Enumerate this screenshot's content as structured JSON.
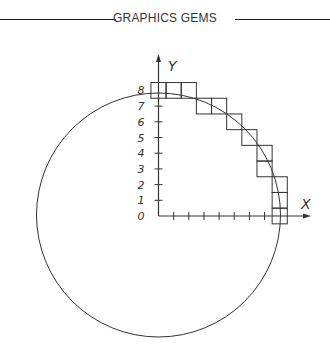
{
  "header": {
    "title": "GRAPHICS GEMS"
  },
  "diagram": {
    "axes": {
      "x_label": "X",
      "y_label": "Y",
      "y_tick_labels": [
        "8",
        "7",
        "6",
        "5",
        "4",
        "3",
        "2",
        "1",
        "0"
      ]
    },
    "colors": {
      "line": "#333333",
      "background": "#ffffff"
    },
    "geometry": {
      "origin_px": [
        158.5,
        216
      ],
      "cell_w": 15.15,
      "cell_h": 15.7,
      "circle_center_px": [
        158.5,
        215
      ],
      "circle_radius_px": 122
    },
    "pixel_cells": [
      {
        "x": 0,
        "y": 8
      },
      {
        "x": 1,
        "y": 8
      },
      {
        "x": 2,
        "y": 8
      },
      {
        "x": 3,
        "y": 7
      },
      {
        "x": 4,
        "y": 7
      },
      {
        "x": 5,
        "y": 6
      },
      {
        "x": 6,
        "y": 5
      },
      {
        "x": 7,
        "y": 4
      },
      {
        "x": 7,
        "y": 3
      },
      {
        "x": 8,
        "y": 2
      },
      {
        "x": 8,
        "y": 1
      },
      {
        "x": 8,
        "y": 0
      }
    ]
  }
}
